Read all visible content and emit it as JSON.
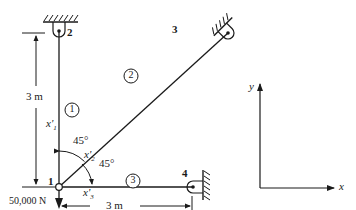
{
  "truss": {
    "nodes": [
      {
        "id": "1",
        "label": "1"
      },
      {
        "id": "2",
        "label": "2"
      },
      {
        "id": "3",
        "label": "3"
      },
      {
        "id": "4",
        "label": "4"
      }
    ],
    "elements": [
      {
        "id": "1",
        "label": "1",
        "from": "1",
        "to": "2",
        "local_axis": "x'",
        "local_subscript": "1"
      },
      {
        "id": "2",
        "label": "2",
        "from": "1",
        "to": "3",
        "local_axis": "x'",
        "local_subscript": "2"
      },
      {
        "id": "3",
        "label": "3",
        "from": "1",
        "to": "4",
        "local_axis": "x'",
        "local_subscript": "3"
      }
    ],
    "angles": {
      "angle_1_2": "45°",
      "angle_2_3": "45°"
    },
    "dimensions": {
      "vertical": "3 m",
      "horizontal": "3 m"
    },
    "load": {
      "label": "50,000 N",
      "direction": "down"
    }
  },
  "global_axes": {
    "x_label": "x",
    "y_label": "y"
  },
  "colors": {
    "ink": "#1a1a1a",
    "background": "#ffffff"
  }
}
